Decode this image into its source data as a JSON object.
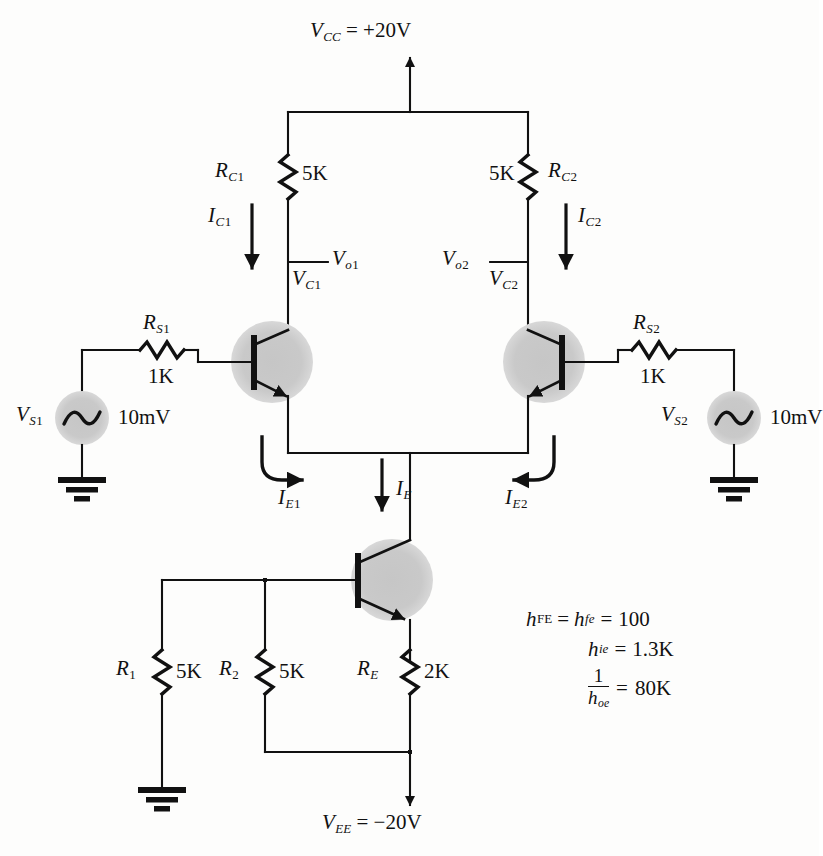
{
  "figure": {
    "type": "schematic",
    "background_color": "#fdfdfc",
    "wire_color": "#111111",
    "device_halo_color": "#c9c9c9"
  },
  "supplies": {
    "vcc": {
      "name": "V",
      "sub": "CC",
      "value": "= +20V",
      "full": "V_CC = +20V"
    },
    "vee": {
      "name": "V",
      "sub": "EE",
      "value": "= −20V",
      "full": "V_EE = −20V"
    }
  },
  "resistors": {
    "rc1": {
      "name": "R",
      "sub": "C",
      "sub2": "1",
      "value": "5K"
    },
    "rc2": {
      "name": "R",
      "sub": "C",
      "sub2": "2",
      "value": "5K"
    },
    "rs1": {
      "name": "R",
      "sub": "S",
      "sub2": "1",
      "value": "1K"
    },
    "rs2": {
      "name": "R",
      "sub": "S",
      "sub2": "2",
      "value": "1K"
    },
    "r1": {
      "name": "R",
      "sub": "1",
      "value": "5K"
    },
    "r2": {
      "name": "R",
      "sub": "2",
      "value": "5K"
    },
    "re": {
      "name": "R",
      "sub": "E",
      "value": "2K"
    }
  },
  "sources": {
    "vs1": {
      "name": "V",
      "sub": "S",
      "sub2": "1",
      "value": "10mV"
    },
    "vs2": {
      "name": "V",
      "sub": "S",
      "sub2": "2",
      "value": "10mV"
    }
  },
  "currents": {
    "ic1": {
      "name": "I",
      "sub": "C",
      "sub2": "1",
      "direction": "down"
    },
    "ic2": {
      "name": "I",
      "sub": "C",
      "sub2": "2",
      "direction": "down"
    },
    "ie1": {
      "name": "I",
      "sub": "E",
      "sub2": "1",
      "direction": "right"
    },
    "ie2": {
      "name": "I",
      "sub": "E",
      "sub2": "2",
      "direction": "left"
    },
    "ie": {
      "name": "I",
      "sub": "E",
      "direction": "down"
    }
  },
  "nodes": {
    "vc1": {
      "name": "V",
      "sub": "C",
      "sub2": "1"
    },
    "vc2": {
      "name": "V",
      "sub": "C",
      "sub2": "2"
    },
    "vo1": {
      "name": "V",
      "sub": "o",
      "sub2": "1"
    },
    "vo2": {
      "name": "V",
      "sub": "o",
      "sub2": "2"
    }
  },
  "parameters": [
    {
      "lhs": "h",
      "lhs_sub": "FE",
      "mid": "=",
      "rhs": "h",
      "rhs_sub": "fe",
      "eq": "=",
      "value": "100"
    },
    {
      "lhs": "",
      "lhs_sub": "",
      "mid": "",
      "rhs": "h",
      "rhs_sub": "ie",
      "eq": "=",
      "value": "1.3K"
    },
    {
      "lhs": "",
      "lhs_sub": "",
      "mid": "",
      "rhs": "1/h",
      "rhs_sub": "oe",
      "eq": "=",
      "value": "80K"
    }
  ],
  "parameter_fraction": {
    "numerator": "1",
    "denominator": "h",
    "denominator_sub": "oe",
    "equals": "=",
    "value": "80K"
  },
  "transistors": [
    {
      "id": "q1",
      "type": "npn",
      "orientation": "left"
    },
    {
      "id": "q2",
      "type": "npn",
      "orientation": "right"
    },
    {
      "id": "q3",
      "type": "npn",
      "orientation": "left"
    }
  ],
  "grounds": [
    {
      "id": "gnd-vs1"
    },
    {
      "id": "gnd-vs2"
    },
    {
      "id": "gnd-r1"
    }
  ]
}
